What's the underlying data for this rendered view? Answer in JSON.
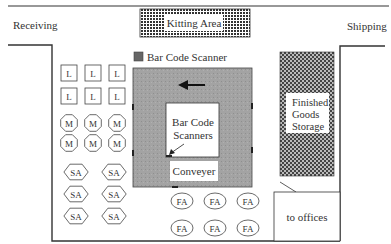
{
  "areas": {
    "receiving": "Receiving",
    "shipping": "Shipping",
    "kitting": "Kitting Area",
    "finished_goods": [
      "Finished",
      "Goods",
      "Storage"
    ],
    "offices": "to offices",
    "conveyer": "Conveyer",
    "scanners_label": [
      "Bar Code",
      "Scanners"
    ]
  },
  "legend": {
    "bar_code_scanner": "Bar Code Scanner",
    "color": "#7a7a7a"
  },
  "stations": {
    "L": {
      "label": "L",
      "shape": "square",
      "count": 6
    },
    "M": {
      "label": "M",
      "shape": "octagon",
      "count": 6
    },
    "SA": {
      "label": "SA",
      "shape": "hexagon",
      "count": 6
    },
    "FA": {
      "label": "FA",
      "shape": "ellipse",
      "count": 6
    }
  },
  "colors": {
    "conveyor_fill": "#9e9e9e",
    "wall": "#333333",
    "hatch_dark": "#555555"
  }
}
